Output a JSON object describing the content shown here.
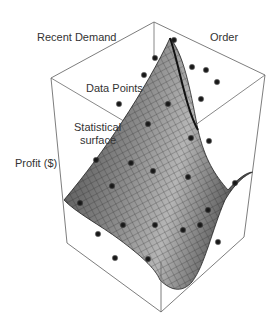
{
  "figure": {
    "labels": {
      "recent_demand": "Recent Demand",
      "order": "Order",
      "data_points": "Data Points",
      "statistical_surface_line1": "Statistical",
      "statistical_surface_line2": "surface",
      "profit": "Profit ($)"
    },
    "colors": {
      "box_line": "#6e6e6e",
      "surface_dark": "#3a3a3a",
      "surface_light": "#b8b8b8",
      "mesh_line": "#1e1e1e",
      "point": "#151515",
      "label_text": "#333333"
    },
    "box": {
      "top_vertex": [
        154,
        22
      ],
      "left_top": [
        51,
        78
      ],
      "right_top": [
        265,
        75
      ],
      "front_top": [
        161,
        140
      ],
      "left_bottom": [
        67,
        243
      ],
      "right_bottom": [
        244,
        237
      ],
      "front_bottom": [
        161,
        312
      ],
      "back_bottom": [
        166,
        146
      ]
    },
    "points": [
      [
        174,
        40
      ],
      [
        155,
        58
      ],
      [
        144,
        75
      ],
      [
        192,
        67
      ],
      [
        206,
        70
      ],
      [
        217,
        82
      ],
      [
        201,
        99
      ],
      [
        119,
        104
      ],
      [
        168,
        104
      ],
      [
        148,
        124
      ],
      [
        191,
        138
      ],
      [
        209,
        141
      ],
      [
        96,
        160
      ],
      [
        131,
        163
      ],
      [
        153,
        171
      ],
      [
        188,
        177
      ],
      [
        235,
        183
      ],
      [
        112,
        186
      ],
      [
        80,
        203
      ],
      [
        208,
        210
      ],
      [
        98,
        234
      ],
      [
        123,
        225
      ],
      [
        155,
        225
      ],
      [
        183,
        230
      ],
      [
        200,
        225
      ],
      [
        115,
        258
      ],
      [
        148,
        259
      ],
      [
        218,
        242
      ]
    ]
  }
}
